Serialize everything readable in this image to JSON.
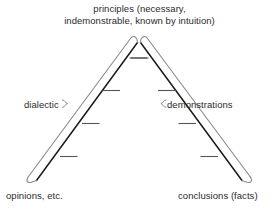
{
  "diagram": {
    "title_lines": [
      "principles (necessary,",
      "indemonstrable, known by intuition)"
    ],
    "left_branch_label": "dialectic",
    "right_branch_label": "demonstrations",
    "left_base_label": "opinions, etc.",
    "right_base_label": "conclusions (facts)",
    "colors": {
      "inner_rail": "#1a1a1a",
      "outer_rail": "#8a8a8a",
      "rung": "#555555",
      "brace": "#8a8a8a",
      "text": "#2b2b2b",
      "background": "#ffffff"
    },
    "geometry": {
      "apex_x": 139,
      "apex_y": 36,
      "left_base_x": 34,
      "right_base_x": 244,
      "base_y": 182,
      "rail_gap": 9,
      "rung_count_per_side": 4
    }
  }
}
